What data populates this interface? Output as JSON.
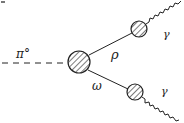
{
  "diagram": {
    "type": "feynman-diagram",
    "corner_mark": "ia",
    "incoming": {
      "particle": "π°",
      "line_style": "dashed"
    },
    "vertex": {
      "style": "hatched-blob"
    },
    "branches": [
      {
        "propagator_label": "ρ",
        "vertex_style": "hatched-blob",
        "outgoing": {
          "label": "γ",
          "line_style": "wavy"
        }
      },
      {
        "propagator_label": "ω",
        "vertex_style": "hatched-blob",
        "outgoing": {
          "label": "γ",
          "line_style": "wavy"
        }
      }
    ]
  },
  "colors": {
    "ink": "#222222",
    "background": "#ffffff"
  }
}
